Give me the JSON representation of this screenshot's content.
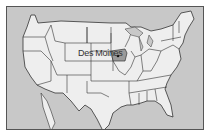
{
  "map": {
    "region": "United States",
    "highlighted_state": "Iowa",
    "city_label": "Des Moines",
    "colors": {
      "water": "#c8c8c8",
      "land": "#eeeeee",
      "highlight": "#9a9a9a",
      "border": "#333333"
    }
  }
}
